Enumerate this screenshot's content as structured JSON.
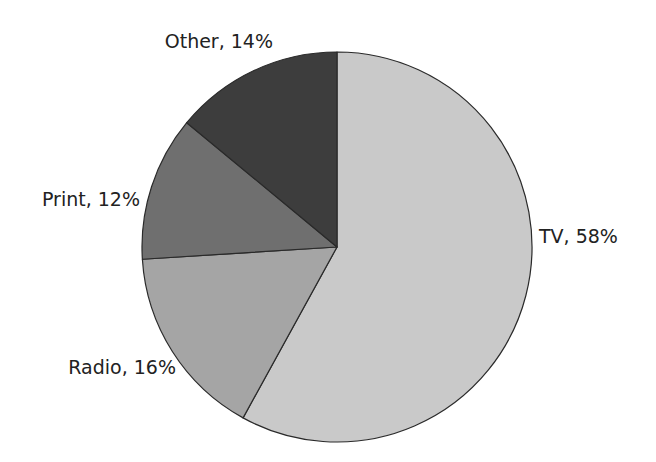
{
  "chart_data": {
    "type": "pie",
    "title": "",
    "start_angle_deg": 0,
    "direction": "clockwise",
    "categories": [
      "TV",
      "Radio",
      "Print",
      "Other"
    ],
    "values": [
      58,
      16,
      12,
      14
    ],
    "unit": "%",
    "labels": [
      "TV, 58%",
      "Radio, 16%",
      "Print, 12%",
      "Other, 14%"
    ],
    "colors": [
      "#c9c9c9",
      "#a5a5a5",
      "#6f6f6f",
      "#3d3d3d"
    ],
    "legend": "none",
    "label_position": "outside"
  },
  "layout": {
    "center": [
      337,
      247
    ],
    "radius": 195,
    "label_anchors": [
      {
        "x": 539,
        "y": 243,
        "anchor": "start"
      },
      {
        "x": 176,
        "y": 374,
        "anchor": "end"
      },
      {
        "x": 140,
        "y": 206,
        "anchor": "end"
      },
      {
        "x": 273,
        "y": 48,
        "anchor": "end"
      }
    ]
  }
}
